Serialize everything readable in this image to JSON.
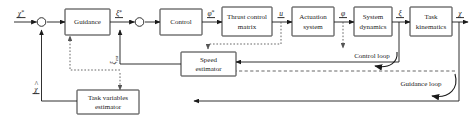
{
  "diagram": {
    "colors": {
      "line": "#1a1a1a",
      "dotted": "#555555",
      "box_fill": "#ffffff",
      "background": "#ffffff"
    },
    "blocks": [
      {
        "id": "guidance",
        "label": "Guidance",
        "line1": "Guidance",
        "line2": ""
      },
      {
        "id": "control",
        "label": "Control",
        "line1": "Control",
        "line2": ""
      },
      {
        "id": "thrust_matrix",
        "label": "Thrust control matrix",
        "line1": "Thrust control",
        "line2": "matrix"
      },
      {
        "id": "actuation",
        "label": "Actuation system",
        "line1": "Actuation",
        "line2": "system"
      },
      {
        "id": "system_dynamics",
        "label": "System dynamics",
        "line1": "System",
        "line2": "dynamics"
      },
      {
        "id": "task_kinematics",
        "label": "Task kinematics",
        "line1": "Task",
        "line2": "kinematics"
      },
      {
        "id": "speed_estimator",
        "label": "Speed estimator",
        "line1": "Speed",
        "line2": "estimator"
      },
      {
        "id": "task_var_estimator",
        "label": "Task variables estimator",
        "line1": "Task variables",
        "line2": "estimator"
      }
    ],
    "signals": [
      {
        "id": "chi_ref",
        "base": "χ",
        "mark": "*",
        "desc": "reference task variables"
      },
      {
        "id": "xi_ref",
        "base": "ξ",
        "mark": "*",
        "desc": "reference system state"
      },
      {
        "id": "phi_ref",
        "base": "φ",
        "mark": "*",
        "desc": "commanded actuator state"
      },
      {
        "id": "u",
        "base": "u",
        "mark": "",
        "desc": "control input"
      },
      {
        "id": "phi",
        "base": "φ",
        "mark": "",
        "desc": "actuator state"
      },
      {
        "id": "xi",
        "base": "ξ",
        "mark": "",
        "desc": "system state"
      },
      {
        "id": "chi",
        "base": "χ",
        "mark": "",
        "desc": "task variables"
      },
      {
        "id": "xi_est",
        "base": "ξ",
        "mark": "est",
        "desc": "estimated system state"
      },
      {
        "id": "chi_est",
        "base": "χ",
        "mark": "^",
        "desc": "estimated task variables"
      }
    ],
    "loops": [
      {
        "id": "control_loop",
        "label": "Control loop"
      },
      {
        "id": "guidance_loop",
        "label": "Guidance loop"
      }
    ],
    "sum_junctions": [
      {
        "id": "sum-1",
        "desc": "guidance error summing junction"
      },
      {
        "id": "sum-2",
        "desc": "control error summing junction"
      }
    ]
  }
}
